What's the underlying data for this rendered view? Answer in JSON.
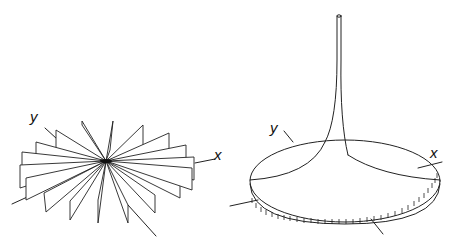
{
  "figures": [
    {
      "id": "left",
      "description": "Star of vertical half-planes radiating from origin (fan of sheets)",
      "axis_labels": {
        "x": "x",
        "y": "y"
      }
    },
    {
      "id": "right",
      "description": "Disk surface with tall narrow spike at center",
      "axis_labels": {
        "x": "x",
        "y": "y"
      }
    }
  ],
  "colors": {
    "stroke": "#222222",
    "background": "#ffffff"
  }
}
